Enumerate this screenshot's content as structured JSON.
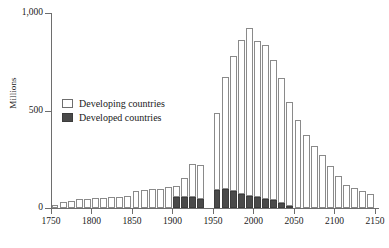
{
  "chart_data": {
    "type": "bar",
    "title": "",
    "subtitle": "",
    "xlabel": "",
    "ylabel": "Millions",
    "xlim": [
      1750,
      2155
    ],
    "ylim": [
      0,
      1000
    ],
    "grid": false,
    "stacked": true,
    "bar_interval_years": 10,
    "legend_position": "inside-upper-left",
    "xticks": [
      "1750",
      "1800",
      "1850",
      "1900",
      "1950",
      "2000",
      "2050",
      "2100",
      "2150"
    ],
    "xtick_values": [
      1750,
      1800,
      1850,
      1900,
      1950,
      2000,
      2050,
      2100,
      2150
    ],
    "yticks": [
      "0",
      "500",
      "1,000"
    ],
    "ytick_values": [
      0,
      500,
      1000
    ],
    "categories": [
      1755,
      1765,
      1775,
      1785,
      1795,
      1805,
      1815,
      1825,
      1835,
      1845,
      1855,
      1865,
      1875,
      1885,
      1895,
      1905,
      1915,
      1925,
      1935,
      1945,
      1955,
      1965,
      1975,
      1985,
      1995,
      2005,
      2015,
      2025,
      2035,
      2045,
      2055,
      2065,
      2075,
      2085,
      2095,
      2105,
      2115,
      2125,
      2135,
      2145
    ],
    "series": [
      {
        "name": "Developed countries",
        "color": "#4a4a4a",
        "values": [
          0,
          0,
          0,
          0,
          0,
          0,
          0,
          0,
          0,
          0,
          0,
          0,
          0,
          0,
          0,
          55,
          58,
          58,
          45,
          0,
          90,
          95,
          88,
          72,
          62,
          55,
          48,
          40,
          25,
          12,
          0,
          0,
          0,
          0,
          0,
          0,
          0,
          0,
          0,
          0
        ]
      },
      {
        "name": "Developing countries",
        "color": "#ffffff",
        "values": [
          18,
          30,
          38,
          44,
          48,
          50,
          52,
          55,
          58,
          60,
          88,
          92,
          96,
          100,
          108,
          58,
          95,
          168,
          175,
          0,
          398,
          575,
          690,
          790,
          860,
          800,
          790,
          720,
          640,
          530,
          450,
          375,
          320,
          270,
          215,
          165,
          120,
          105,
          85,
          72
        ]
      }
    ],
    "totals": [
      18,
      30,
      38,
      44,
      48,
      50,
      52,
      55,
      58,
      60,
      88,
      92,
      96,
      100,
      108,
      113,
      153,
      226,
      220,
      0,
      488,
      670,
      778,
      862,
      922,
      855,
      838,
      760,
      665,
      542,
      450,
      375,
      320,
      270,
      215,
      165,
      120,
      105,
      85,
      72
    ]
  },
  "legend": {
    "entries": [
      {
        "label": "Developing countries",
        "swatch": "outlined-white-square"
      },
      {
        "label": "Developed countries",
        "swatch": "filled-dark-square"
      }
    ]
  },
  "axes": {
    "y_label": "Millions",
    "y_tick_labels": [
      "1,000",
      "500",
      "0"
    ],
    "x_tick_labels": [
      "1750",
      "1800",
      "1850",
      "1900",
      "1950",
      "2000",
      "2050",
      "2100",
      "2150"
    ]
  }
}
